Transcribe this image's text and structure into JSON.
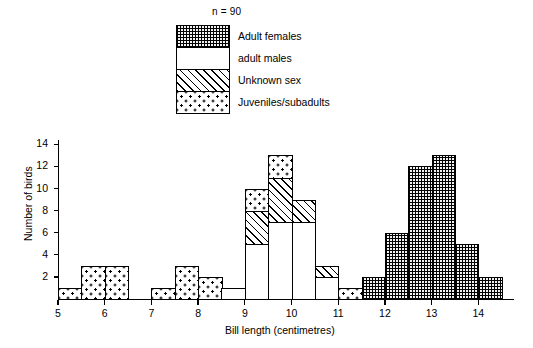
{
  "legend": {
    "sample_size_label": "n = 90",
    "items": [
      {
        "label": "Adult females",
        "pattern": "crosshatch",
        "icon": "crosshatch-swatch-icon"
      },
      {
        "label": "adult males",
        "pattern": "white",
        "icon": "white-swatch-icon"
      },
      {
        "label": "Unknown sex",
        "pattern": "diagonal",
        "icon": "diagonal-swatch-icon"
      },
      {
        "label": "Juveniles/subadults",
        "pattern": "dots",
        "icon": "dots-swatch-icon"
      }
    ]
  },
  "chart_data": {
    "type": "bar",
    "title": "",
    "xlabel": "Bill length (centimetres)",
    "ylabel": "Number of birds",
    "xlim": [
      5,
      14.5
    ],
    "ylim": [
      0,
      14
    ],
    "bin_width": 0.5,
    "grid": false,
    "legend_position": "top-right",
    "stacked": true,
    "x_tick_labels": [
      "5",
      "6",
      "7",
      "8",
      "9",
      "10",
      "11",
      "12",
      "13",
      "14"
    ],
    "x_tick_values": [
      5,
      6,
      7,
      8,
      9,
      10,
      11,
      12,
      13,
      14
    ],
    "y_tick_labels": [
      "2",
      "4",
      "6",
      "8",
      "10",
      "12",
      "14"
    ],
    "y_tick_values": [
      2,
      4,
      6,
      8,
      10,
      12,
      14
    ],
    "categories": [
      "Adult females",
      "adult males",
      "Unknown sex",
      "Juveniles/subadults"
    ],
    "bins": [
      {
        "x0": 5.0,
        "x1": 5.5,
        "total": 1,
        "segments": [
          {
            "category": "Juveniles/subadults",
            "value": 1
          }
        ]
      },
      {
        "x0": 5.5,
        "x1": 6.0,
        "total": 3,
        "segments": [
          {
            "category": "Juveniles/subadults",
            "value": 3
          }
        ]
      },
      {
        "x0": 6.0,
        "x1": 6.5,
        "total": 3,
        "segments": [
          {
            "category": "Juveniles/subadults",
            "value": 3
          }
        ]
      },
      {
        "x0": 7.0,
        "x1": 7.5,
        "total": 1,
        "segments": [
          {
            "category": "Juveniles/subadults",
            "value": 1
          }
        ]
      },
      {
        "x0": 7.5,
        "x1": 8.0,
        "total": 3,
        "segments": [
          {
            "category": "Juveniles/subadults",
            "value": 3
          }
        ]
      },
      {
        "x0": 8.0,
        "x1": 8.5,
        "total": 2,
        "segments": [
          {
            "category": "Juveniles/subadults",
            "value": 2
          }
        ]
      },
      {
        "x0": 8.5,
        "x1": 9.0,
        "total": 1,
        "segments": [
          {
            "category": "adult males",
            "value": 1
          }
        ]
      },
      {
        "x0": 9.0,
        "x1": 9.5,
        "total": 10,
        "segments": [
          {
            "category": "adult males",
            "value": 5
          },
          {
            "category": "Unknown sex",
            "value": 3
          },
          {
            "category": "Juveniles/subadults",
            "value": 2
          }
        ]
      },
      {
        "x0": 9.5,
        "x1": 10.0,
        "total": 13,
        "segments": [
          {
            "category": "adult males",
            "value": 7
          },
          {
            "category": "Unknown sex",
            "value": 4
          },
          {
            "category": "Juveniles/subadults",
            "value": 2
          }
        ]
      },
      {
        "x0": 10.0,
        "x1": 10.5,
        "total": 9,
        "segments": [
          {
            "category": "adult males",
            "value": 7
          },
          {
            "category": "Unknown sex",
            "value": 2
          }
        ]
      },
      {
        "x0": 10.5,
        "x1": 11.0,
        "total": 3,
        "segments": [
          {
            "category": "adult males",
            "value": 2
          },
          {
            "category": "Unknown sex",
            "value": 1
          }
        ]
      },
      {
        "x0": 11.0,
        "x1": 11.5,
        "total": 1,
        "segments": [
          {
            "category": "Juveniles/subadults",
            "value": 1
          }
        ]
      },
      {
        "x0": 11.5,
        "x1": 12.0,
        "total": 2,
        "segments": [
          {
            "category": "Adult females",
            "value": 2
          }
        ]
      },
      {
        "x0": 12.0,
        "x1": 12.5,
        "total": 6,
        "segments": [
          {
            "category": "Adult females",
            "value": 6
          }
        ]
      },
      {
        "x0": 12.5,
        "x1": 13.0,
        "total": 12,
        "segments": [
          {
            "category": "Adult females",
            "value": 12
          }
        ]
      },
      {
        "x0": 13.0,
        "x1": 13.5,
        "total": 13,
        "segments": [
          {
            "category": "Adult females",
            "value": 13
          }
        ]
      },
      {
        "x0": 13.5,
        "x1": 14.0,
        "total": 5,
        "segments": [
          {
            "category": "Adult females",
            "value": 5
          }
        ]
      },
      {
        "x0": 14.0,
        "x1": 14.5,
        "total": 2,
        "segments": [
          {
            "category": "Adult females",
            "value": 2
          }
        ]
      }
    ]
  },
  "geometry": {
    "x_origin_px": 58,
    "px_per_x_unit": 46.7,
    "y_baseline_px": 299,
    "px_per_y_unit": 11.05
  }
}
